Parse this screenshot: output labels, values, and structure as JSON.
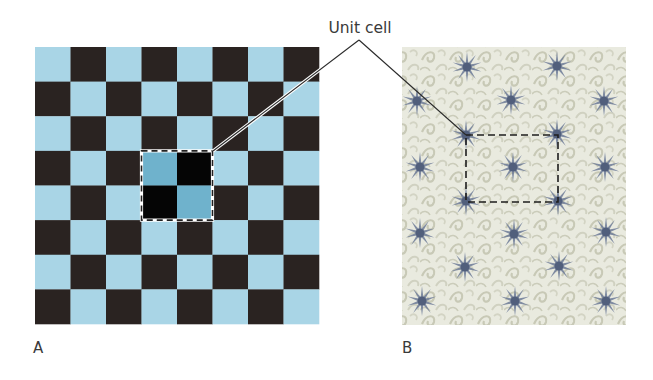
{
  "figure": {
    "callout": {
      "label": "Unit cell",
      "label_x": 360,
      "label_y": 33,
      "apex": [
        359,
        40
      ],
      "targets": [
        [
          213,
          151
        ],
        [
          466,
          135
        ]
      ]
    },
    "panels": [
      {
        "id": "A",
        "label": "A",
        "label_pos": [
          33,
          353
        ],
        "kind": "checkerboard",
        "x": 35,
        "y": 47,
        "width": 284,
        "height": 277,
        "cols": 8,
        "rows": 8,
        "first_cell": "light",
        "colors": {
          "light": "#a9d5e6",
          "dark": "#2a2321",
          "unit_light": "#6fb2cc",
          "unit_dark": "#050505"
        },
        "unit_cell": {
          "col": 3,
          "row": 3,
          "cols": 2,
          "rows": 2
        }
      },
      {
        "id": "B",
        "label": "B",
        "label_pos": [
          402,
          353
        ],
        "kind": "wallpaper",
        "x": 402,
        "y": 47,
        "width": 224,
        "height": 278,
        "colors": {
          "background": "#e9eadf",
          "swirl": "#c9c9b8",
          "star": "#6c7a96",
          "star_core": "#4d5a78"
        },
        "stars": [
          [
            467,
            67
          ],
          [
            557,
            66
          ],
          [
            417,
            101
          ],
          [
            511,
            100
          ],
          [
            604,
            101
          ],
          [
            466,
            135
          ],
          [
            557,
            134
          ],
          [
            513,
            167
          ],
          [
            420,
            167
          ],
          [
            605,
            167
          ],
          [
            466,
            201
          ],
          [
            558,
            201
          ],
          [
            420,
            233
          ],
          [
            514,
            234
          ],
          [
            606,
            232
          ],
          [
            465,
            267
          ],
          [
            559,
            266
          ],
          [
            422,
            301
          ],
          [
            515,
            301
          ],
          [
            606,
            301
          ]
        ],
        "unit_cell": {
          "x": 466,
          "y": 135,
          "width": 92,
          "height": 67
        }
      }
    ]
  }
}
